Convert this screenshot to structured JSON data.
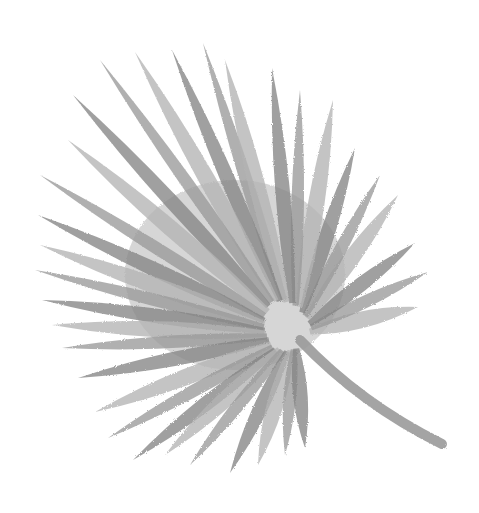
{
  "image": {
    "subject": "Watercolor fan palm leaf",
    "style": "grayscale watercolor illustration",
    "background": "#ffffff",
    "colors": {
      "leaf_base": "#9a9a9a",
      "leaf_dark": "#858585",
      "leaf_light": "#b4b4b4"
    },
    "hub": [
      295,
      335
    ],
    "stem": {
      "from": [
        300,
        340
      ],
      "to": [
        442,
        444
      ],
      "width": 10
    },
    "leaflet_tips": [
      [
        203,
        43
      ],
      [
        172,
        50
      ],
      [
        135,
        52
      ],
      [
        100,
        60
      ],
      [
        73,
        95
      ],
      [
        68,
        140
      ],
      [
        40,
        175
      ],
      [
        38,
        215
      ],
      [
        40,
        245
      ],
      [
        35,
        270
      ],
      [
        42,
        300
      ],
      [
        52,
        325
      ],
      [
        62,
        348
      ],
      [
        78,
        378
      ],
      [
        95,
        412
      ],
      [
        108,
        438
      ],
      [
        133,
        460
      ],
      [
        165,
        455
      ],
      [
        190,
        465
      ],
      [
        230,
        473
      ],
      [
        258,
        465
      ],
      [
        285,
        455
      ],
      [
        305,
        448
      ],
      [
        418,
        307
      ],
      [
        428,
        272
      ],
      [
        415,
        243
      ],
      [
        398,
        195
      ],
      [
        380,
        175
      ],
      [
        355,
        148
      ],
      [
        333,
        100
      ],
      [
        300,
        90
      ],
      [
        272,
        68
      ],
      [
        225,
        60
      ]
    ]
  }
}
